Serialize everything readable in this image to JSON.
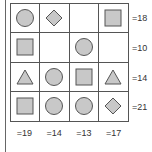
{
  "puzzle": {
    "grid": [
      [
        "circle",
        "diamond",
        "",
        "square"
      ],
      [
        "square",
        "",
        "circle",
        ""
      ],
      [
        "triangle",
        "circle",
        "square",
        "triangle"
      ],
      [
        "square",
        "circle",
        "circle",
        "diamond"
      ]
    ],
    "row_sums": [
      "=18",
      "=10",
      "=14",
      "=21"
    ],
    "col_sums": [
      "=19",
      "=14",
      "=13",
      "=17"
    ]
  },
  "colors": {
    "shape_fill": "#c8c8c8",
    "shape_stroke": "#555555"
  }
}
